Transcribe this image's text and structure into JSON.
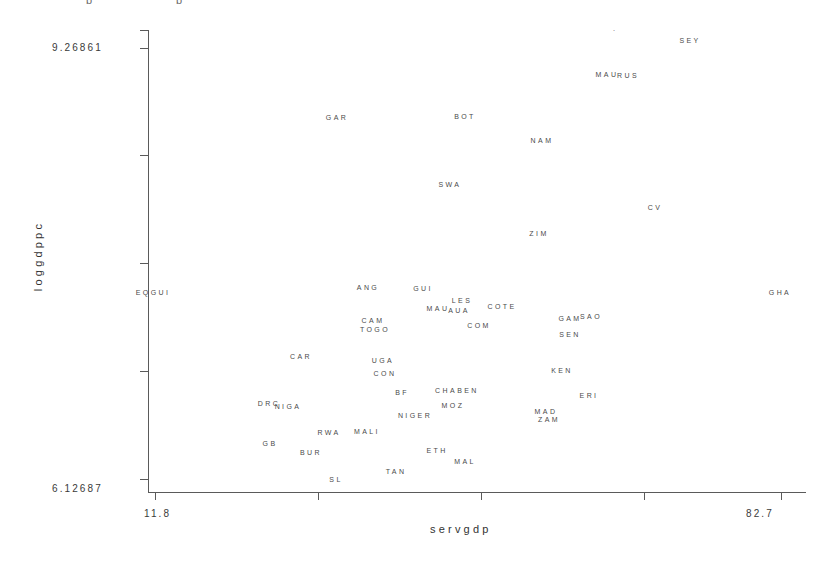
{
  "chart_data": {
    "type": "scatter",
    "title": "",
    "xlabel": "servgdp",
    "ylabel": "loggdppc",
    "xlim": [
      11.8,
      82.7
    ],
    "ylim": [
      6.12687,
      9.26861
    ],
    "x_tick_labels": [
      "11.8",
      "82.7"
    ],
    "y_tick_labels": [
      "9.26861",
      "6.12687"
    ],
    "grid": false,
    "legend": null,
    "marker_style": "text-label",
    "note": "Each data point is drawn as its country abbreviation text rather than a marker symbol.",
    "points": [
      {
        "label": "SEY",
        "x": 62.8,
        "y": 9.252,
        "px": 690,
        "py": 40
      },
      {
        "label": "́",
        "x": 54.7,
        "y": 9.258,
        "px": 616,
        "py": 34
      },
      {
        "label": "MAU",
        "x": 52.9,
        "y": 9.08,
        "px": 607,
        "py": 74
      },
      {
        "label": "RUS",
        "x": 54.5,
        "y": 9.075,
        "px": 628,
        "py": 75
      },
      {
        "label": "GAR",
        "x": 31.8,
        "y": 8.858,
        "px": 337,
        "py": 117
      },
      {
        "label": "BOT",
        "x": 45.3,
        "y": 8.86,
        "px": 465,
        "py": 116
      },
      {
        "label": "NAM",
        "x": 50.6,
        "y": 8.792,
        "px": 542,
        "py": 140
      },
      {
        "label": "SWA",
        "x": 44.3,
        "y": 8.652,
        "px": 450,
        "py": 184
      },
      {
        "label": "CV",
        "x": 62.0,
        "y": 8.58,
        "px": 655,
        "py": 207
      },
      {
        "label": "ZIM",
        "x": 49.5,
        "y": 8.506,
        "px": 539,
        "py": 233
      },
      {
        "label": "EQGUI",
        "x": 12.2,
        "y": 8.34,
        "px": 153,
        "py": 292
      },
      {
        "label": "ANG",
        "x": 34.6,
        "y": 8.35,
        "px": 368,
        "py": 287
      },
      {
        "label": "GUI",
        "x": 40.0,
        "y": 8.348,
        "px": 423,
        "py": 288
      },
      {
        "label": "GHA",
        "x": 81.0,
        "y": 8.34,
        "px": 780,
        "py": 292
      },
      {
        "label": "LES",
        "x": 44.0,
        "y": 8.318,
        "px": 462,
        "py": 300
      },
      {
        "label": "COTE",
        "x": 48.0,
        "y": 8.3,
        "px": 502,
        "py": 306
      },
      {
        "label": "MAU2",
        "x": 42.0,
        "y": 8.296,
        "px": 438,
        "py": 308
      },
      {
        "label": "AUA",
        "x": 43.7,
        "y": 8.29,
        "px": 459,
        "py": 310
      },
      {
        "label": "CAM",
        "x": 33.9,
        "y": 8.25,
        "px": 373,
        "py": 320
      },
      {
        "label": "GAM",
        "x": 55.0,
        "y": 8.255,
        "px": 570,
        "py": 318
      },
      {
        "label": "SAO",
        "x": 57.2,
        "y": 8.262,
        "px": 591,
        "py": 316
      },
      {
        "label": "COM",
        "x": 46.2,
        "y": 8.23,
        "px": 479,
        "py": 325
      },
      {
        "label": "TOGO",
        "x": 34.1,
        "y": 8.222,
        "px": 375,
        "py": 329
      },
      {
        "label": "SEN",
        "x": 55.4,
        "y": 8.205,
        "px": 570,
        "py": 334
      },
      {
        "label": "CAR",
        "x": 28.1,
        "y": 8.138,
        "px": 301,
        "py": 356
      },
      {
        "label": "UGA",
        "x": 35.5,
        "y": 8.128,
        "px": 383,
        "py": 360
      },
      {
        "label": "KEN",
        "x": 53.0,
        "y": 8.1,
        "px": 562,
        "py": 370
      },
      {
        "label": "CON",
        "x": 35.8,
        "y": 8.09,
        "px": 385,
        "py": 373
      },
      {
        "label": "BF",
        "x": 37.0,
        "y": 8.03,
        "px": 402,
        "py": 392
      },
      {
        "label": "CHA",
        "x": 41.8,
        "y": 8.03,
        "px": 446,
        "py": 390
      },
      {
        "label": "BEN",
        "x": 44.2,
        "y": 8.025,
        "px": 468,
        "py": 390
      },
      {
        "label": "ERI",
        "x": 55.6,
        "y": 8.01,
        "px": 589,
        "py": 395
      },
      {
        "label": "DRC",
        "x": 26.4,
        "y": 7.975,
        "px": 269,
        "py": 403
      },
      {
        "label": "NIGA",
        "x": 27.6,
        "y": 7.965,
        "px": 288,
        "py": 406
      },
      {
        "label": "MOZ",
        "x": 43.3,
        "y": 7.965,
        "px": 453,
        "py": 405
      },
      {
        "label": "NIGER",
        "x": 37.6,
        "y": 7.93,
        "px": 415,
        "py": 415
      },
      {
        "label": "MAD",
        "x": 51.4,
        "y": 7.935,
        "px": 546,
        "py": 411
      },
      {
        "label": "ZAM",
        "x": 52.0,
        "y": 7.915,
        "px": 549,
        "py": 419
      },
      {
        "label": "RWA",
        "x": 30.7,
        "y": 7.88,
        "px": 329,
        "py": 432
      },
      {
        "label": "MALI",
        "x": 33.6,
        "y": 7.882,
        "px": 367,
        "py": 431
      },
      {
        "label": "GB",
        "x": 25.0,
        "y": 7.84,
        "px": 270,
        "py": 443
      },
      {
        "label": "BUR",
        "x": 29.2,
        "y": 7.81,
        "px": 311,
        "py": 452
      },
      {
        "label": "ETH",
        "x": 40.8,
        "y": 7.808,
        "px": 437,
        "py": 450
      },
      {
        "label": "MAL",
        "x": 43.4,
        "y": 7.78,
        "px": 465,
        "py": 461
      },
      {
        "label": "TAN",
        "x": 36.3,
        "y": 7.745,
        "px": 396,
        "py": 471
      },
      {
        "label": "SL",
        "x": 30.6,
        "y": 7.72,
        "px": 336,
        "py": 479
      }
    ]
  },
  "axes": {
    "y": {
      "title": "loggdppc",
      "max_label": "9.26861",
      "min_label": "6.12687"
    },
    "x": {
      "title": "servgdp",
      "min_label": "11.8",
      "max_label": "82.7"
    }
  },
  "colors": {
    "background": "#ffffff",
    "axis": "#5a5a5a",
    "label_text": "#4a4a4a",
    "axis_text": "#333333"
  },
  "top_crop": {
    "fragment_a": "p",
    "fragment_b": "p"
  }
}
